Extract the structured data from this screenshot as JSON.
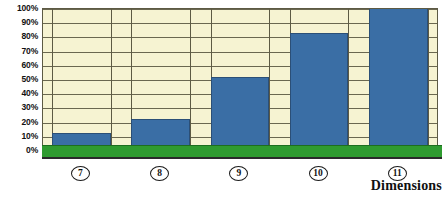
{
  "chart_data": {
    "type": "bar",
    "title": "",
    "subtitle": "",
    "xlabel": "Dimensions",
    "ylabel": "",
    "categories": [
      "7",
      "8",
      "9",
      "10",
      "11"
    ],
    "values": [
      11,
      21,
      51,
      82,
      100
    ],
    "ylim": [
      0,
      100
    ],
    "yticks": [
      0,
      10,
      20,
      30,
      40,
      50,
      60,
      70,
      80,
      90,
      100
    ],
    "ytick_labels": [
      "0%",
      "10%",
      "20%",
      "30%",
      "40%",
      "50%",
      "60%",
      "70%",
      "80%",
      "90%",
      "100%"
    ],
    "xtick_labels": [
      "7",
      "8",
      "9",
      "10",
      "11"
    ],
    "series": [
      {
        "name": "",
        "values": [
          11,
          21,
          51,
          82,
          100
        ]
      }
    ],
    "grid": true,
    "grid_axis": "y",
    "legend": false,
    "legend_position": "none",
    "annotations": [],
    "colors": {
      "bar_fill": "#3a6ea5",
      "bar_border": "#2b4f77",
      "plot_background": "#f6f3d2",
      "grid_line": "#6a6750",
      "plot_border": "#5d5a44",
      "baseline_green": "#2f9b30",
      "text": "#111111",
      "page_background": "#ffffff"
    }
  },
  "axis": {
    "x_title": "Dimensions"
  }
}
